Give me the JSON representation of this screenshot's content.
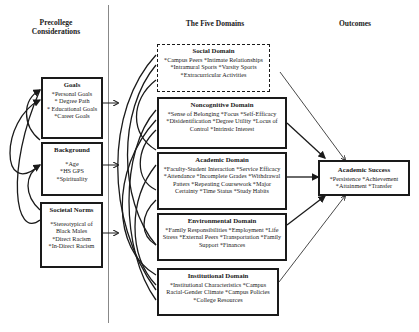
{
  "columns": {
    "precollege": "Precollege Considerations",
    "domains": "The Five Domains",
    "outcomes": "Outcomes"
  },
  "precollege": {
    "goals": {
      "title": "Goals",
      "items": [
        "*Personal Goals",
        "* Degree Path",
        "* Educational Goals",
        "*Career Goals"
      ]
    },
    "background": {
      "title": "Background",
      "items": [
        "*Age",
        "*HS GPS",
        "*Spirituality"
      ]
    },
    "societal_norms": {
      "title": "Societal Norms",
      "items": [
        "*Stereotypical of Black Males",
        "*Direct Racism",
        "*In-Direct Racism"
      ]
    }
  },
  "domains": {
    "social": {
      "title": "Social Domain",
      "text": "*Campus Peers *Intimate Relationships *Intramural Sports *Varsity Sports *Extracurricular Activities"
    },
    "noncognitive": {
      "title": "Noncognitive Domain",
      "text": "*Sense of Belonging *Focus *Self-Efficacy *Disidentification *Degree Utility *Locus of Control *Intrinsic Interest"
    },
    "academic": {
      "title": "Academic Domain",
      "text": "*Faculty-Student Interaction *Service Efficacy *Attendance *Incomplete Grades *Withdrawal Patters *Repeating Coursework *Major Certainty *Time Status *Study Habits"
    },
    "environmental": {
      "title": "Environmental Domain",
      "text": "*Family Responsibilities *Employment *Life Stress *External Peers *Transportation *Family Support *Finances"
    },
    "institutional": {
      "title": "Institutional Domain",
      "text": "*Institutional Characteristics *Campus Racial-Gender Climate *Campus Policies *College Resources"
    }
  },
  "outcome": {
    "title": "Academic Success",
    "text": "*Persistence *Achievement *Attainment *Transfer"
  },
  "colors": {
    "line": "#1a1a1a",
    "divider": "#888888",
    "background": "#ffffff"
  }
}
